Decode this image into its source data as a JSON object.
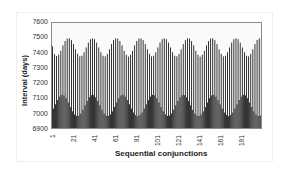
{
  "chart_data": {
    "type": "bar",
    "title": "",
    "xlabel": "Sequential conjunctions",
    "ylabel": "Interval (days)",
    "ylim": [
      6900,
      7600
    ],
    "yticks": [
      6900,
      7000,
      7100,
      7200,
      7300,
      7400,
      7500,
      7600
    ],
    "xticks": [
      "1",
      "21",
      "41",
      "61",
      "81",
      "101",
      "121",
      "141",
      "161",
      "181"
    ],
    "x_range": [
      1,
      200
    ],
    "grid": false,
    "legend": "none",
    "bar_color": "#000000",
    "series": [
      {
        "name": "Upper envelope (alternate conjunctions)",
        "x_start": 1,
        "x_step": 2,
        "values": [
          7448,
          7396,
          7384,
          7392,
          7418,
          7454,
          7482,
          7498,
          7500,
          7488,
          7462,
          7428,
          7398,
          7382,
          7386,
          7408,
          7440,
          7472,
          7494,
          7500,
          7494,
          7472,
          7440,
          7408,
          7386,
          7382,
          7398,
          7428,
          7462,
          7488,
          7500,
          7498,
          7482,
          7454,
          7418,
          7392,
          7380,
          7392,
          7418,
          7454,
          7482,
          7498,
          7500,
          7488,
          7462,
          7428,
          7398,
          7382,
          7386,
          7408,
          7440,
          7472,
          7494,
          7500,
          7494,
          7472,
          7440,
          7408,
          7386,
          7382,
          7398,
          7428,
          7462,
          7488,
          7500,
          7498,
          7482,
          7454,
          7418,
          7392,
          7380,
          7392,
          7418,
          7454,
          7482,
          7498,
          7500,
          7488,
          7462,
          7428,
          7398,
          7382,
          7386,
          7408,
          7440,
          7472,
          7494,
          7500,
          7494,
          7472,
          7440,
          7408,
          7386,
          7382,
          7398,
          7428,
          7462,
          7488,
          7500,
          7498
        ]
      },
      {
        "name": "Lower envelope (alternate conjunctions)",
        "x_start": 2,
        "x_step": 2,
        "values": [
          7040,
          7068,
          7096,
          7118,
          7130,
          7126,
          7108,
          7080,
          7050,
          7022,
          7002,
          6992,
          6994,
          7008,
          7032,
          7062,
          7090,
          7114,
          7128,
          7128,
          7114,
          7090,
          7062,
          7032,
          7008,
          6994,
          6992,
          7002,
          7022,
          7050,
          7080,
          7108,
          7126,
          7130,
          7118,
          7096,
          7068,
          7040,
          7014,
          6998,
          6990,
          6998,
          7014,
          7040,
          7068,
          7096,
          7118,
          7130,
          7126,
          7108,
          7080,
          7050,
          7022,
          7002,
          6992,
          6994,
          7008,
          7032,
          7062,
          7090,
          7114,
          7128,
          7128,
          7114,
          7090,
          7062,
          7032,
          7008,
          6994,
          6992,
          7002,
          7022,
          7050,
          7080,
          7108,
          7126,
          7130,
          7118,
          7096,
          7068,
          7040,
          7014,
          6998,
          6990,
          6998,
          7014,
          7040,
          7068,
          7096,
          7118,
          7130,
          7126,
          7108,
          7080,
          7050,
          7022,
          7002,
          6992,
          6994,
          7008
        ]
      }
    ]
  }
}
